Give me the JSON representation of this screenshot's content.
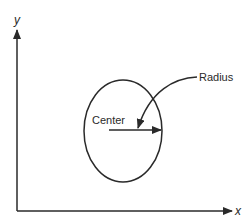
{
  "diagram": {
    "axes": {
      "x_label": "x",
      "y_label": "y"
    },
    "circle": {
      "center_label": "Center",
      "radius_label": "Radius"
    },
    "colors": {
      "stroke": "#2a2a2a",
      "background": "#ffffff"
    }
  }
}
